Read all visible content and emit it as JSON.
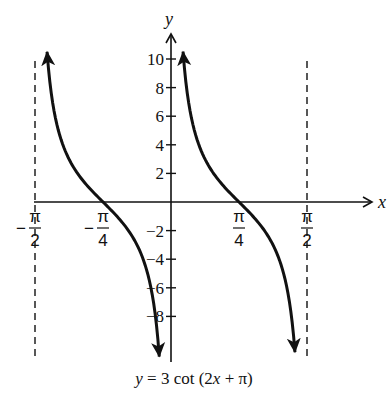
{
  "chart_data": {
    "type": "line",
    "title": "y = 3 cot (2x + π)",
    "function": "y = 3 cot (2x + π)",
    "xlabel": "x",
    "ylabel": "y",
    "xlim": [
      -1.5708,
      1.5708
    ],
    "ylim": [
      -10,
      10
    ],
    "x_ticks": [
      {
        "value": -1.5708,
        "label_num": "π",
        "label_den": "2",
        "sign": "−"
      },
      {
        "value": -0.7854,
        "label_num": "π",
        "label_den": "4",
        "sign": "−"
      },
      {
        "value": 0.7854,
        "label_num": "π",
        "label_den": "4",
        "sign": ""
      },
      {
        "value": 1.5708,
        "label_num": "π",
        "label_den": "2",
        "sign": ""
      }
    ],
    "y_ticks": [
      10,
      8,
      6,
      4,
      2,
      -2,
      -4,
      -6,
      -8
    ],
    "y_tick_labels": [
      "10",
      "8",
      "6",
      "4",
      "2",
      "−2",
      "−4",
      "−6",
      "−8"
    ],
    "asymptotes": [
      -1.5708,
      0,
      1.5708
    ],
    "asymptote_style": "dashed",
    "series": [
      {
        "name": "branch-1",
        "x_range": [
          -1.4317,
          -0.1354
        ],
        "zero_crossing": -0.7854,
        "arrow_both_ends": true
      },
      {
        "name": "branch-2",
        "x_range": [
          0.139,
          1.4317
        ],
        "zero_crossing": 0.7854,
        "arrow_both_ends": true
      }
    ],
    "sample_points": [
      {
        "x": -1.4317,
        "y": 10.5
      },
      {
        "x": -1.309,
        "y": 5.196
      },
      {
        "x": -1.1781,
        "y": 3.0
      },
      {
        "x": -0.7854,
        "y": 0
      },
      {
        "x": -0.3927,
        "y": -3.0
      },
      {
        "x": -0.2618,
        "y": -5.196
      },
      {
        "x": 0.2618,
        "y": 5.196
      },
      {
        "x": 0.3927,
        "y": 3.0
      },
      {
        "x": 0.7854,
        "y": 0
      },
      {
        "x": 1.1781,
        "y": -3.0
      },
      {
        "x": 1.309,
        "y": -5.196
      }
    ],
    "grid": false,
    "legend": null
  },
  "labels": {
    "x_axis": "x",
    "y_axis": "y",
    "caption": "y = 3 cot (2x + π)"
  }
}
